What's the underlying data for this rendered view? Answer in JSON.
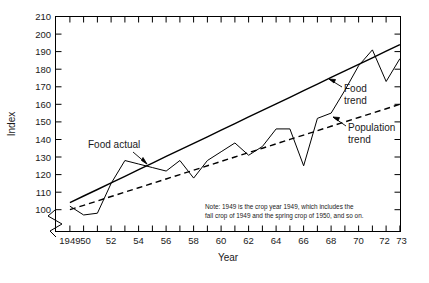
{
  "chart_data": {
    "type": "line",
    "title": "",
    "xlabel": "Year",
    "ylabel": "Index",
    "xlim": [
      1949,
      1973
    ],
    "ylim": [
      95,
      210
    ],
    "grid": false,
    "legend_position": "inline-annotations",
    "y_ticks": [
      100,
      110,
      120,
      130,
      140,
      150,
      160,
      170,
      180,
      190,
      200,
      210
    ],
    "y_tick_labels": [
      "100",
      "110",
      "120",
      "130",
      "140",
      "150",
      "160",
      "170",
      "180",
      "190",
      "200",
      "210"
    ],
    "y_axis_broken_below": 100,
    "x_ticks": [
      1949,
      1950,
      1951,
      1952,
      1953,
      1954,
      1955,
      1956,
      1957,
      1958,
      1959,
      1960,
      1961,
      1962,
      1963,
      1964,
      1965,
      1966,
      1967,
      1968,
      1969,
      1970,
      1971,
      1972,
      1973
    ],
    "x_tick_labels": [
      "1949",
      "50",
      "",
      "52",
      "",
      "54",
      "",
      "56",
      "",
      "58",
      "",
      "60",
      "",
      "62",
      "",
      "64",
      "",
      "66",
      "",
      "68",
      "",
      "70",
      "",
      "72",
      "73"
    ],
    "x": [
      1949,
      1950,
      1951,
      1952,
      1953,
      1954,
      1955,
      1956,
      1957,
      1958,
      1959,
      1960,
      1961,
      1962,
      1963,
      1964,
      1965,
      1966,
      1967,
      1968,
      1969,
      1970,
      1971,
      1972,
      1973
    ],
    "series": [
      {
        "name": "Food actual",
        "style": "solid-thin",
        "values": [
          102,
          97,
          98,
          115,
          128,
          126,
          124,
          122,
          128,
          118,
          128,
          133,
          138,
          131,
          136,
          146,
          146,
          125,
          152,
          155,
          168,
          182,
          191,
          173,
          186
        ]
      },
      {
        "name": "Food trend",
        "style": "solid-thick",
        "values": [
          104,
          107.8,
          111.5,
          115.3,
          119,
          122.8,
          126.5,
          130.3,
          134,
          137.8,
          141.5,
          145.3,
          149,
          152.8,
          156.5,
          160.3,
          164,
          167.8,
          171.5,
          175.3,
          179,
          182.8,
          186.5,
          190.3,
          194
        ]
      },
      {
        "name": "Population trend",
        "style": "dashed",
        "values": [
          100,
          102.5,
          105,
          107.5,
          110,
          112.5,
          115,
          117.5,
          120,
          122.5,
          125,
          127.5,
          130,
          132.5,
          135,
          137.5,
          140,
          142.5,
          145,
          147.5,
          150,
          152.5,
          155,
          157.5,
          160
        ]
      }
    ],
    "annotations": [
      {
        "name": "food-actual",
        "label": "Food actual"
      },
      {
        "name": "food-trend",
        "label": "Food\ntrend",
        "line1": "Food",
        "line2": "trend"
      },
      {
        "name": "population-trend",
        "label": "Population\ntrend",
        "line1": "Population",
        "line2": "trend"
      }
    ],
    "note": {
      "line1": "Note: 1949 is the crop year 1949, which includes the",
      "line2": "fall crop of 1949 and the spring crop of 1950, and so on."
    }
  }
}
